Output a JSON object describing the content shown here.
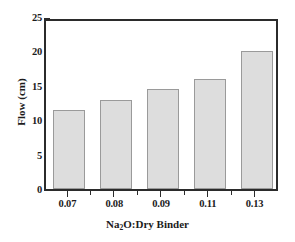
{
  "chart_data": {
    "type": "bar",
    "title": "",
    "xlabel": "Na2O:Dry Binder",
    "xlabel_prefix": "Na",
    "xlabel_sub": "2",
    "xlabel_suffix": "O:Dry Binder",
    "ylabel": "Flow (cm)",
    "categories": [
      "0.07",
      "0.08",
      "0.09",
      "0.11",
      "0.13"
    ],
    "values": [
      11.5,
      13.0,
      14.5,
      16.0,
      20.0
    ],
    "ylim": [
      0,
      25
    ],
    "xlim": [
      0,
      5
    ],
    "y_ticks": [
      "0",
      "5",
      "10",
      "15",
      "20",
      "25"
    ],
    "y_tick_values": [
      0,
      5,
      10,
      15,
      20,
      25
    ],
    "y_minor_tick_values": [
      2.5,
      7.5,
      12.5,
      17.5,
      22.5
    ],
    "grid": false,
    "legend": false,
    "bar_fill_color": "#dddddd",
    "bar_edge_color": "#9a9a9a",
    "axis_color": "#2b2b2b",
    "background_color": "#ffffff"
  }
}
